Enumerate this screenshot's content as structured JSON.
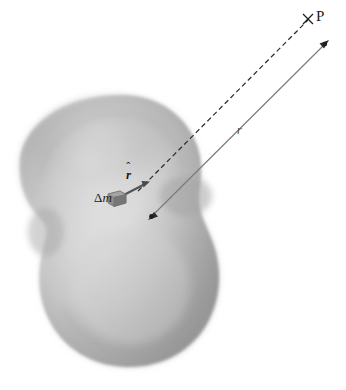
{
  "figure": {
    "background_color": "#ffffff",
    "width": 346,
    "height": 390,
    "body": {
      "name": "irregular-extended-body",
      "fill_light": "#e8e8e8",
      "fill_mid": "#b9b9b9",
      "fill_dark": "#8f8f8f",
      "edge_color": "#9a9a9a"
    },
    "labels": {
      "point_p": "P",
      "mass_element_delta": "Δ",
      "mass_element_m": "m",
      "unit_vector": "r",
      "unit_vector_hat": "ˆ",
      "distance": "r"
    },
    "marks": {
      "point_p_cross": "×"
    },
    "elements": {
      "mass_block": "mass-element-block",
      "dashed_line": "dashed-line-to-p",
      "solid_vector": "distance-vector-r",
      "unit_vector_arrow": "unit-vector-r-hat"
    },
    "colors": {
      "line": "#3a3a3a",
      "dashed": "#2f2f2f",
      "solid_vector": "#6f6f6f",
      "mass_block": "#8a8a8a",
      "text": "#1a1a1a"
    }
  }
}
